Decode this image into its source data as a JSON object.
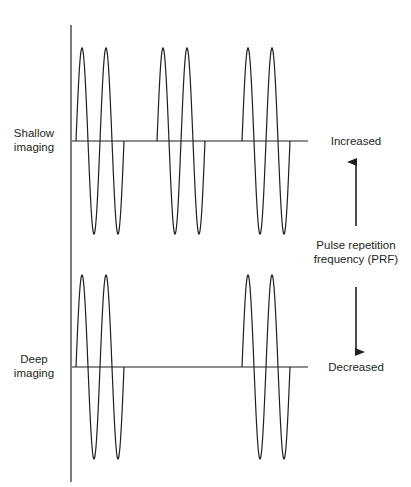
{
  "labels": {
    "shallow": [
      "Shallow",
      "imaging"
    ],
    "deep": [
      "Deep",
      "imaging"
    ],
    "increased": "Increased",
    "decreased": "Decreased",
    "prf": [
      "Pulse repetition",
      "frequency (PRF)"
    ]
  },
  "colors": {
    "line": "#231f20",
    "background": "#ffffff"
  },
  "axis": {
    "x": 71,
    "y_top": 25,
    "y_bottom": 482
  },
  "traces": [
    {
      "name": "shallow-imaging",
      "baseline_y": 141,
      "x_start": 72,
      "x_end": 308,
      "amplitude": 93,
      "cycles_per_pulse": 2,
      "period_px": 24,
      "pulse_starts_x": [
        76,
        157,
        242
      ]
    },
    {
      "name": "deep-imaging",
      "baseline_y": 367,
      "x_start": 72,
      "x_end": 308,
      "amplitude": 92,
      "cycles_per_pulse": 2,
      "period_px": 24,
      "pulse_starts_x": [
        76,
        242
      ]
    }
  ],
  "arrows": {
    "up": {
      "x": 356,
      "y_from": 226,
      "y_to": 162
    },
    "down": {
      "x": 356,
      "y_from": 287,
      "y_to": 352
    }
  }
}
